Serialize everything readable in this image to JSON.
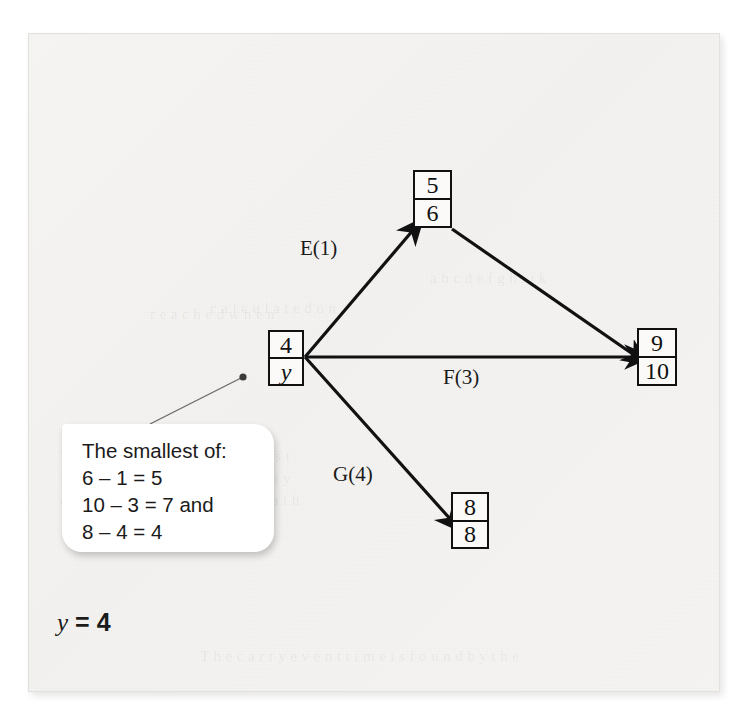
{
  "figure": {
    "type": "activity-network-diagram",
    "nodes": [
      {
        "id": "start",
        "top": "4",
        "bottom": "y",
        "x": 268,
        "y": 330,
        "w": 36,
        "h": 56
      },
      {
        "id": "top",
        "top": "5",
        "bottom": "6",
        "x": 413,
        "y": 170,
        "w": 39,
        "h": 58
      },
      {
        "id": "right",
        "top": "9",
        "bottom": "10",
        "x": 637,
        "y": 328,
        "w": 40,
        "h": 58
      },
      {
        "id": "bottom",
        "top": "8",
        "bottom": "8",
        "x": 451,
        "y": 492,
        "w": 38,
        "h": 57
      }
    ],
    "edges": [
      {
        "id": "E",
        "label": "E(1)",
        "from": "start",
        "to": "top",
        "label_x": 300,
        "label_y": 236
      },
      {
        "id": "F",
        "label": "F(3)",
        "from": "start",
        "to": "right",
        "label_x": 443,
        "label_y": 365
      },
      {
        "id": "G",
        "label": "G(4)",
        "from": "start",
        "to": "bottom",
        "label_x": 333,
        "label_y": 462
      },
      {
        "id": "H",
        "label": "",
        "from": "top",
        "to": "right",
        "label_x": 0,
        "label_y": 0
      }
    ]
  },
  "callout": {
    "lines": [
      "The smallest of:",
      "6 – 1 = 5",
      "10 – 3 = 7 and",
      "8 – 4 = 4"
    ]
  },
  "result": {
    "variable": "y",
    "equals": "=",
    "value": "4"
  },
  "ghost_text": [
    {
      "text": "a b c d e f g h i j k",
      "x": 430,
      "y": 270
    },
    {
      "text": "c a l c u l a t e d   o n",
      "x": 210,
      "y": 300
    },
    {
      "text": "r e a c h e d   w h e n",
      "x": 150,
      "y": 306
    },
    {
      "text": "W i t h   n o d e   w h e r e   e a r l i e s t",
      "x": 60,
      "y": 448
    },
    {
      "text": "i s   t h e   d e p e n d e n t   a c t i v i t y",
      "x": 60,
      "y": 470
    },
    {
      "text": "d u r a t i o n   a n d   c r i t i c a l   p a t h",
      "x": 60,
      "y": 492
    },
    {
      "text": "T h e   c a r r y   e v e n t   t i m e   i s   f o u n d   b y   t h e",
      "x": 200,
      "y": 648
    }
  ],
  "colors": {
    "ink": "#111111",
    "page": "#f6f5f3",
    "callout_bg": "#ffffff"
  }
}
